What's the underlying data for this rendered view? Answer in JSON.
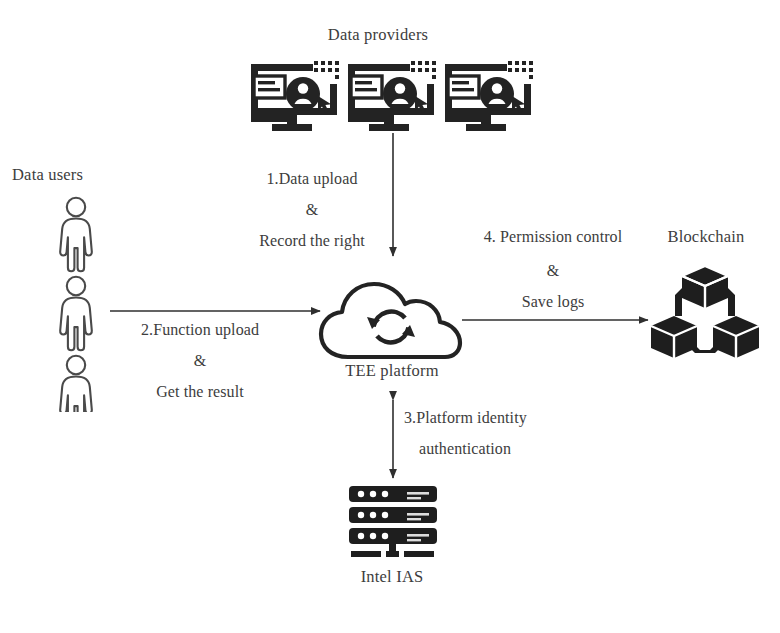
{
  "diagram": {
    "background_color": "#ffffff",
    "ink_color": "#3d3d3d",
    "nodes": [
      {
        "id": "data-providers",
        "label": "Data providers",
        "icon": "monitor-user-icon",
        "count": 3
      },
      {
        "id": "data-users",
        "label": "Data users",
        "icon": "person-icon",
        "count": 3
      },
      {
        "id": "tee-platform",
        "label": "TEE platform",
        "icon": "cloud-sync-icon"
      },
      {
        "id": "blockchain",
        "label": "Blockchain",
        "icon": "blockchain-cubes-icon"
      },
      {
        "id": "intel-ias",
        "label": "Intel IAS",
        "icon": "server-rack-icon"
      }
    ],
    "flows": [
      {
        "id": "flow-1",
        "from": "data-providers",
        "to": "tee-platform",
        "direction": "down",
        "line1": "1.Data upload",
        "conjunction": "&",
        "line2": "Record the right"
      },
      {
        "id": "flow-2",
        "from": "data-users",
        "to": "tee-platform",
        "direction": "right",
        "line1": "2.Function upload",
        "conjunction": "&",
        "line2": "Get the result"
      },
      {
        "id": "flow-3",
        "from": "tee-platform",
        "to": "intel-ias",
        "direction": "bidirectional-vertical",
        "line1": "3.Platform identity",
        "conjunction": "",
        "line2": "authentication"
      },
      {
        "id": "flow-4",
        "from": "tee-platform",
        "to": "blockchain",
        "direction": "right",
        "line1": "4. Permission control",
        "conjunction": "&",
        "line2": "Save logs"
      }
    ]
  }
}
